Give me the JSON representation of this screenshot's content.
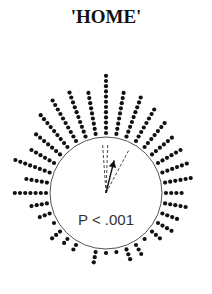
{
  "title": "'HOME'",
  "stat_label": "P < .001",
  "diagram": {
    "type": "circular-dot-plot",
    "center": [
      106,
      193
    ],
    "radius": 56,
    "dot_radius": 2.1,
    "dot_spacing": 5.2,
    "mean_vector_deg": 14,
    "ci_lines_deg": [
      -4,
      2,
      28
    ],
    "bins_deg": [
      0,
      10,
      20,
      30,
      40,
      50,
      60,
      70,
      80,
      90,
      100,
      110,
      120,
      130,
      140,
      150,
      160,
      170,
      180,
      190,
      200,
      210,
      220,
      230,
      240,
      250,
      260,
      270,
      280,
      290,
      300,
      310,
      320,
      330,
      340,
      350
    ],
    "counts": [
      12,
      9,
      9,
      8,
      7,
      6,
      6,
      6,
      6,
      4,
      5,
      4,
      4,
      3,
      1,
      3,
      3,
      1,
      1,
      3,
      0,
      2,
      2,
      3,
      1,
      3,
      4,
      7,
      5,
      8,
      6,
      7,
      9,
      10,
      10,
      9
    ]
  }
}
